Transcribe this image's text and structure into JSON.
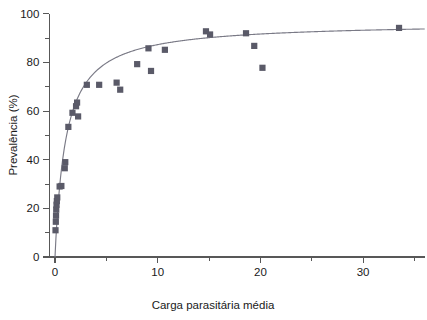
{
  "chart_data": {
    "type": "scatter",
    "title": "",
    "xlabel": "Carga parasitária média",
    "ylabel": "Prevalência (%)",
    "xlim": [
      -0.55,
      36.0
    ],
    "ylim": [
      0,
      100
    ],
    "xticks": [
      0,
      10,
      20,
      30
    ],
    "xtick_labels": [
      "0",
      "10",
      "20",
      "30"
    ],
    "xticks_minor": [
      5,
      15,
      25,
      35
    ],
    "yticks": [
      0,
      20,
      40,
      60,
      80,
      100
    ],
    "ytick_labels": [
      "0",
      "20",
      "40",
      "60",
      "80",
      "100"
    ],
    "yticks_minor": [
      10,
      30,
      50,
      70,
      90
    ],
    "grid": false,
    "legend": "none",
    "marker": "square",
    "marker_color": "#5a5a68",
    "curve_color": "#7a7a86",
    "axis_color": "#585858",
    "background": "#ffffff",
    "points": [
      {
        "x": 0.05,
        "y": 11.0
      },
      {
        "x": 0.08,
        "y": 14.5
      },
      {
        "x": 0.1,
        "y": 17.0
      },
      {
        "x": 0.12,
        "y": 19.5
      },
      {
        "x": 0.15,
        "y": 21.5
      },
      {
        "x": 0.18,
        "y": 23.0
      },
      {
        "x": 0.22,
        "y": 24.5
      },
      {
        "x": 0.45,
        "y": 29.0
      },
      {
        "x": 0.62,
        "y": 29.2
      },
      {
        "x": 0.95,
        "y": 36.5
      },
      {
        "x": 1.0,
        "y": 39.0
      },
      {
        "x": 1.3,
        "y": 53.5
      },
      {
        "x": 1.7,
        "y": 59.3
      },
      {
        "x": 2.05,
        "y": 62.0
      },
      {
        "x": 2.15,
        "y": 63.5
      },
      {
        "x": 2.25,
        "y": 57.8
      },
      {
        "x": 3.1,
        "y": 70.8
      },
      {
        "x": 4.3,
        "y": 70.8
      },
      {
        "x": 6.0,
        "y": 71.7
      },
      {
        "x": 6.35,
        "y": 68.8
      },
      {
        "x": 8.0,
        "y": 79.3
      },
      {
        "x": 9.1,
        "y": 85.8
      },
      {
        "x": 9.35,
        "y": 76.5
      },
      {
        "x": 10.7,
        "y": 85.2
      },
      {
        "x": 14.7,
        "y": 92.8
      },
      {
        "x": 15.1,
        "y": 91.5
      },
      {
        "x": 18.6,
        "y": 92.0
      },
      {
        "x": 19.4,
        "y": 86.8
      },
      {
        "x": 20.2,
        "y": 77.8
      },
      {
        "x": 33.5,
        "y": 94.2
      }
    ],
    "fit_curve": {
      "description": "saturating asymptotic fit through scatter",
      "model": "y = ymax * x / (k + x)",
      "ymax": 96.5,
      "k": 1.05,
      "x_start": 0.0,
      "x_end": 36.0
    }
  }
}
